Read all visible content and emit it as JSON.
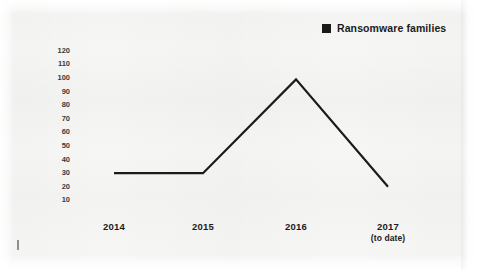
{
  "legend": {
    "marker": "black-square",
    "label": "Ransomware families",
    "color": "#1b1b1b",
    "position": "top-right"
  },
  "chart_data": {
    "type": "line",
    "title": "",
    "subtitle": "",
    "xlabel": "",
    "ylabel": "",
    "categories": [
      "2014",
      "2015",
      "2016",
      "2017"
    ],
    "category_sublabels": [
      "",
      "",
      "",
      "(to date)"
    ],
    "series": [
      {
        "name": "Ransomware families",
        "color": "#1b1b1b",
        "values": [
          30,
          30,
          99,
          20
        ]
      }
    ],
    "ylim": [
      0,
      125
    ],
    "yticks": [
      10,
      20,
      30,
      40,
      50,
      60,
      70,
      80,
      90,
      100,
      110,
      120
    ],
    "ytick_labels": [
      "10",
      "20",
      "30",
      "40",
      "50",
      "60",
      "70",
      "80",
      "90",
      "100",
      "110",
      "120"
    ],
    "grid": false,
    "axis_lines": false,
    "markers": false,
    "line_width_px": 2,
    "legend": "top-right"
  },
  "style": {
    "background": "#f6f6f5",
    "text_color": "#1b1b1b",
    "tick_color": "#3b3b3b"
  }
}
